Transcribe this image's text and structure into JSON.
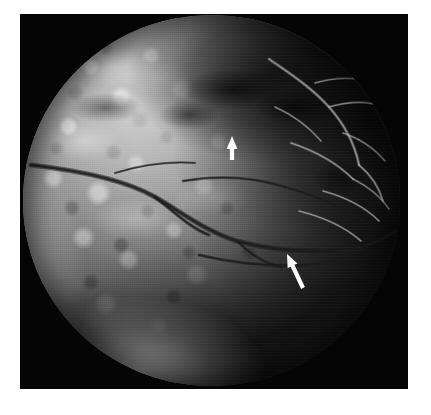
{
  "figure": {
    "kind": "fundus-fluorescein-angiogram",
    "modality_label": "Fluorescein angiogram of the ocular fundus",
    "eye_field": "posterior pole / mid-periphery",
    "background_color": "#ffffff",
    "plate_color": "#050505",
    "caption": "",
    "title": ""
  },
  "plate": {
    "x": 20,
    "y": 14,
    "width": 388,
    "height": 375,
    "border_color": "#050505"
  },
  "fundus": {
    "center_x": 191,
    "center_y": 186,
    "radius": 188,
    "description": "Circular fundus camera field showing diffuse mottled hyperfluorescence superiorly and temporally with darker hypofluorescent zones",
    "bright_region": "superior-nasal quadrant",
    "dark_region": "superior-temporal quadrant",
    "rim_highlight": "inferior-nasal crescent"
  },
  "annotations": {
    "arrows": [
      {
        "id": "arrow-1",
        "label": "upper arrow",
        "direction": "up",
        "angle_deg": 0,
        "tip_x": 232,
        "tip_y": 136,
        "tail_x": 232,
        "tail_y": 160,
        "color": "#ffffff",
        "points_to": "focal lesion at superior vascular arcade"
      },
      {
        "id": "arrow-2",
        "label": "lower arrow",
        "direction": "up-left",
        "angle_deg": -28,
        "tip_x": 287,
        "tip_y": 254,
        "tail_x": 303,
        "tail_y": 288,
        "color": "#ffffff",
        "points_to": "vessel abnormality at inferior arcade"
      }
    ]
  },
  "vessels": {
    "dark_arcade_note": "hypofluorescent retinal vessels crossing the central horizontal band",
    "bright_network_note": "hyperfluorescent vascular network in the temporal field",
    "dark_paths": [
      "M 8 150 C 60 156, 104 166, 132 182 C 160 198, 182 216, 214 226 C 250 236, 290 238, 330 234",
      "M 132 182 C 150 196, 166 212, 186 220",
      "M 214 226 C 226 238, 240 248, 258 252",
      "M 330 234 C 348 230, 362 224, 372 216",
      "M 160 166 C 196 160, 230 162, 262 172",
      "M 262 172 C 292 180, 318 192, 340 206",
      "M 92 158 C 118 150, 146 146, 172 148",
      "M 176 240 C 210 248, 248 252, 284 250",
      "M 284 250 C 306 248, 324 242, 340 234"
    ],
    "light_paths": [
      "M 246 44 C 266 58, 288 72, 306 92 C 322 110, 332 130, 336 150",
      "M 306 92 C 326 86, 346 86, 362 92",
      "M 336 150 C 348 160, 356 172, 360 186",
      "M 292 68 C 312 62, 334 62, 352 68",
      "M 320 118 C 338 124, 352 134, 362 146",
      "M 268 128 C 292 136, 314 148, 330 164",
      "M 300 176 C 322 182, 342 192, 356 206",
      "M 276 196 C 300 202, 322 212, 338 226",
      "M 330 164 C 346 172, 358 182, 366 194",
      "M 252 92 C 270 100, 286 112, 298 126"
    ]
  }
}
